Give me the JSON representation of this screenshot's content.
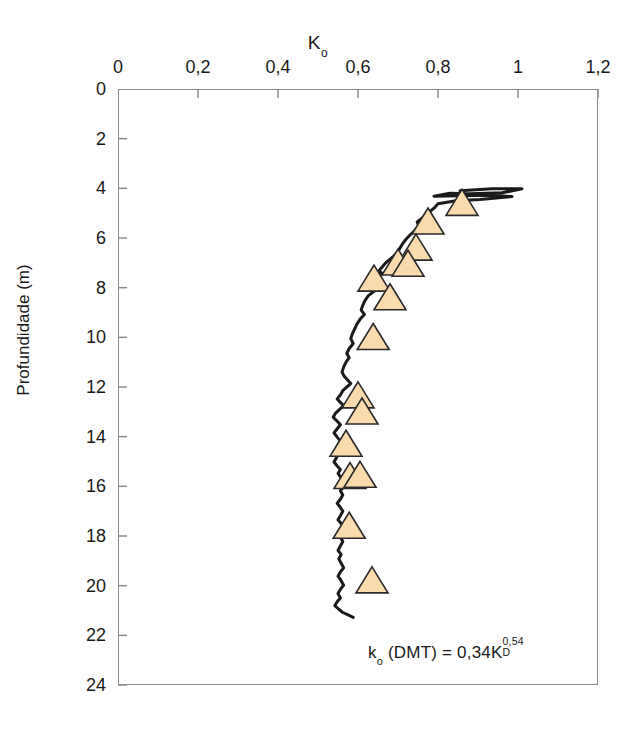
{
  "chart_data": {
    "type": "line",
    "title": "",
    "xlabel": "K_o",
    "xlabel_main": "K",
    "xlabel_sub": "o",
    "ylabel": "Profundidade (m)",
    "xlim": [
      0,
      1.2
    ],
    "ylim": [
      0,
      24
    ],
    "y_inverted": true,
    "grid": false,
    "legend": null,
    "x_ticks": [
      0,
      0.2,
      0.4,
      0.6,
      0.8,
      1,
      1.2
    ],
    "x_tick_labels": [
      "0",
      "0,2",
      "0,4",
      "0,6",
      "0,8",
      "1",
      "1,2"
    ],
    "y_ticks": [
      0,
      2,
      4,
      6,
      8,
      10,
      12,
      14,
      16,
      18,
      20,
      22,
      24
    ],
    "y_tick_labels": [
      "0",
      "2",
      "4",
      "6",
      "8",
      "10",
      "12",
      "14",
      "16",
      "18",
      "20",
      "22",
      "24"
    ],
    "annotation": "k_o (DMT) = 0,34K_D^0,54",
    "annotation_parts": {
      "lead": "k",
      "lead_sub": "o",
      "mid": " (DMT) = 0,34K",
      "var_sub": "D",
      "var_sup": "0,54"
    },
    "series": [
      {
        "name": "continuous-profile",
        "type": "line",
        "color": "#1a1a1a",
        "points": [
          [
            0.855,
            4.1
          ],
          [
            0.935,
            4.02
          ],
          [
            1.01,
            4.02
          ],
          [
            0.96,
            4.18
          ],
          [
            0.88,
            4.22
          ],
          [
            0.83,
            4.2
          ],
          [
            0.79,
            4.32
          ],
          [
            0.855,
            4.3
          ],
          [
            0.94,
            4.28
          ],
          [
            0.985,
            4.33
          ],
          [
            0.905,
            4.45
          ],
          [
            0.845,
            4.5
          ],
          [
            0.8,
            4.62
          ],
          [
            0.79,
            4.8
          ],
          [
            0.775,
            5.0
          ],
          [
            0.76,
            5.2
          ],
          [
            0.748,
            5.35
          ],
          [
            0.752,
            5.52
          ],
          [
            0.742,
            5.7
          ],
          [
            0.73,
            5.88
          ],
          [
            0.72,
            6.05
          ],
          [
            0.712,
            6.22
          ],
          [
            0.705,
            6.4
          ],
          [
            0.7,
            6.55
          ],
          [
            0.69,
            6.72
          ],
          [
            0.678,
            6.88
          ],
          [
            0.668,
            7.02
          ],
          [
            0.66,
            7.18
          ],
          [
            0.652,
            7.32
          ],
          [
            0.662,
            7.45
          ],
          [
            0.648,
            7.58
          ],
          [
            0.636,
            7.72
          ],
          [
            0.628,
            7.88
          ],
          [
            0.632,
            8.02
          ],
          [
            0.64,
            8.15
          ],
          [
            0.626,
            8.32
          ],
          [
            0.618,
            8.5
          ],
          [
            0.612,
            8.7
          ],
          [
            0.608,
            8.9
          ],
          [
            0.616,
            9.08
          ],
          [
            0.606,
            9.25
          ],
          [
            0.598,
            9.45
          ],
          [
            0.592,
            9.65
          ],
          [
            0.586,
            9.85
          ],
          [
            0.582,
            10.05
          ],
          [
            0.588,
            10.25
          ],
          [
            0.578,
            10.45
          ],
          [
            0.572,
            10.65
          ],
          [
            0.578,
            10.82
          ],
          [
            0.57,
            11.0
          ],
          [
            0.564,
            11.2
          ],
          [
            0.56,
            11.4
          ],
          [
            0.566,
            11.58
          ],
          [
            0.574,
            11.72
          ],
          [
            0.582,
            11.86
          ],
          [
            0.572,
            12.0
          ],
          [
            0.562,
            12.15
          ],
          [
            0.556,
            12.32
          ],
          [
            0.548,
            12.48
          ],
          [
            0.556,
            12.62
          ],
          [
            0.564,
            12.75
          ],
          [
            0.554,
            12.9
          ],
          [
            0.544,
            13.05
          ],
          [
            0.538,
            13.22
          ],
          [
            0.548,
            13.38
          ],
          [
            0.556,
            13.52
          ],
          [
            0.548,
            13.68
          ],
          [
            0.54,
            13.85
          ],
          [
            0.548,
            14.02
          ],
          [
            0.556,
            14.18
          ],
          [
            0.55,
            14.35
          ],
          [
            0.544,
            14.52
          ],
          [
            0.552,
            14.68
          ],
          [
            0.546,
            14.85
          ],
          [
            0.54,
            15.02
          ],
          [
            0.548,
            15.18
          ],
          [
            0.556,
            15.32
          ],
          [
            0.55,
            15.48
          ],
          [
            0.556,
            15.62
          ],
          [
            0.564,
            15.75
          ],
          [
            0.572,
            15.88
          ],
          [
            0.564,
            16.02
          ],
          [
            0.556,
            16.18
          ],
          [
            0.562,
            16.35
          ],
          [
            0.556,
            16.52
          ],
          [
            0.548,
            16.68
          ],
          [
            0.556,
            16.85
          ],
          [
            0.562,
            17.0
          ],
          [
            0.556,
            17.18
          ],
          [
            0.55,
            17.35
          ],
          [
            0.558,
            17.5
          ],
          [
            0.566,
            17.62
          ],
          [
            0.572,
            17.75
          ],
          [
            0.564,
            17.9
          ],
          [
            0.556,
            18.05
          ],
          [
            0.562,
            18.22
          ],
          [
            0.556,
            18.4
          ],
          [
            0.55,
            18.58
          ],
          [
            0.558,
            18.75
          ],
          [
            0.552,
            18.92
          ],
          [
            0.558,
            19.1
          ],
          [
            0.564,
            19.28
          ],
          [
            0.556,
            19.45
          ],
          [
            0.55,
            19.62
          ],
          [
            0.558,
            19.8
          ],
          [
            0.564,
            19.98
          ],
          [
            0.556,
            20.15
          ],
          [
            0.55,
            20.32
          ],
          [
            0.556,
            20.5
          ],
          [
            0.548,
            20.65
          ],
          [
            0.542,
            20.8
          ],
          [
            0.552,
            20.95
          ],
          [
            0.562,
            21.08
          ],
          [
            0.575,
            21.18
          ],
          [
            0.588,
            21.28
          ]
        ]
      },
      {
        "name": "dmt-measurements",
        "type": "scatter",
        "marker": "triangle-up",
        "fill": "#f9dbae",
        "edge": "#2b2b2b",
        "points": [
          [
            0.86,
            4.65
          ],
          [
            0.775,
            5.4
          ],
          [
            0.745,
            6.45
          ],
          [
            0.7,
            7.05
          ],
          [
            0.725,
            7.1
          ],
          [
            0.64,
            7.7
          ],
          [
            0.68,
            8.45
          ],
          [
            0.638,
            10.05
          ],
          [
            0.6,
            12.4
          ],
          [
            0.61,
            13.05
          ],
          [
            0.57,
            14.35
          ],
          [
            0.58,
            15.65
          ],
          [
            0.605,
            15.6
          ],
          [
            0.578,
            17.65
          ],
          [
            0.635,
            19.85
          ]
        ]
      }
    ]
  },
  "axis": {
    "top_label_main": "K",
    "top_label_sub": "o",
    "left_label": "Profundidade (m)"
  }
}
